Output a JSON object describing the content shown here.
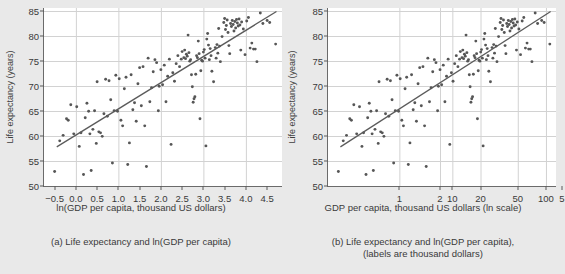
{
  "figure": {
    "background": "#e9e9e9",
    "point_color": "#565656",
    "line_color": "#5b5b5b",
    "grid_color": "#d2d2d2",
    "plot_background": "#ffffff"
  },
  "panels": [
    {
      "id": "a",
      "caption": "(a) Life expectancy and ln(GDP per capita)",
      "caption_line2": "",
      "ylabel": "Life expectancy (years)",
      "xlabel": "ln(GDP per capita, thousand US dollars)",
      "xticks": [
        "-0.5",
        "0.0",
        "0.5",
        "1.0",
        "1.5",
        "2.0",
        "2.5",
        "3.0",
        "3.5",
        "4.0",
        "4.5"
      ],
      "yticks": [
        "50",
        "55",
        "60",
        "65",
        "70",
        "75",
        "80",
        "85"
      ]
    },
    {
      "id": "b",
      "caption": "(b) Life expectancy and ln(GDP per capita),",
      "caption_line2": "(labels are thousand dollars)",
      "ylabel": "Life expectancy (years)",
      "xlabel": "GDP per capita, thousand US dollars (ln scale)",
      "xticks": [
        "1",
        "2",
        "5",
        "10",
        "20",
        "50",
        "100"
      ],
      "yticks": [
        "50",
        "55",
        "60",
        "65",
        "70",
        "75",
        "80",
        "85"
      ]
    }
  ],
  "chart_data": {
    "type": "scatter",
    "title": "",
    "n_panels": 2,
    "panel_a": {
      "type": "scatter",
      "title": "(a) Life expectancy and ln(GDP per capita)",
      "xlabel": "ln(GDP per capita, thousand US dollars)",
      "ylabel": "Life expectancy (years)",
      "xlim": [
        -0.75,
        4.85
      ],
      "ylim": [
        50,
        85.5
      ],
      "xtick_values": [
        -0.5,
        0.0,
        0.5,
        1.0,
        1.5,
        2.0,
        2.5,
        3.0,
        3.5,
        4.0,
        4.5
      ],
      "xtick_labels": [
        "-0.5",
        "0.0",
        "0.5",
        "1.0",
        "1.5",
        "2.0",
        "2.5",
        "3.0",
        "3.5",
        "4.0",
        "4.5"
      ],
      "ytick_values": [
        50,
        55,
        60,
        65,
        70,
        75,
        80,
        85
      ],
      "ytick_labels": [
        "50",
        "55",
        "60",
        "65",
        "70",
        "75",
        "80",
        "85"
      ],
      "grid": true,
      "grid_x_values": [
        0,
        1,
        2,
        3,
        4
      ],
      "grid_y_values": [
        55,
        60,
        65,
        70,
        75,
        80,
        85
      ],
      "legend": "none",
      "fit_line": {
        "x": [
          -0.45,
          4.72
        ],
        "y": [
          57.8,
          84.8
        ],
        "slope": 5.22,
        "intercept": 60.15
      },
      "x_scale": "linear",
      "points": [
        [
          -0.5,
          52.9
        ],
        [
          -0.38,
          59.0
        ],
        [
          -0.3,
          60.1
        ],
        [
          -0.22,
          63.4
        ],
        [
          -0.18,
          63.1
        ],
        [
          -0.12,
          66.2
        ],
        [
          -0.05,
          60.4
        ],
        [
          0.02,
          65.8
        ],
        [
          0.08,
          57.9
        ],
        [
          0.12,
          60.6
        ],
        [
          0.18,
          52.3
        ],
        [
          0.22,
          63.6
        ],
        [
          0.26,
          66.5
        ],
        [
          0.3,
          64.9
        ],
        [
          0.33,
          60.4
        ],
        [
          0.36,
          53.1
        ],
        [
          0.4,
          61.3
        ],
        [
          0.44,
          65.0
        ],
        [
          0.48,
          58.5
        ],
        [
          0.5,
          70.8
        ],
        [
          0.54,
          60.8
        ],
        [
          0.58,
          60.6
        ],
        [
          0.62,
          59.9
        ],
        [
          0.66,
          64.4
        ],
        [
          0.7,
          71.3
        ],
        [
          0.74,
          63.9
        ],
        [
          0.78,
          71.0
        ],
        [
          0.82,
          67.2
        ],
        [
          0.86,
          54.6
        ],
        [
          0.9,
          65.0
        ],
        [
          0.94,
          72.1
        ],
        [
          0.98,
          64.9
        ],
        [
          1.02,
          71.4
        ],
        [
          1.06,
          63.1
        ],
        [
          1.1,
          62.0
        ],
        [
          1.14,
          69.4
        ],
        [
          1.18,
          71.7
        ],
        [
          1.22,
          54.3
        ],
        [
          1.26,
          58.6
        ],
        [
          1.3,
          72.2
        ],
        [
          1.34,
          65.2
        ],
        [
          1.38,
          66.6
        ],
        [
          1.42,
          62.9
        ],
        [
          1.46,
          70.4
        ],
        [
          1.5,
          73.6
        ],
        [
          1.54,
          66.0
        ],
        [
          1.58,
          73.8
        ],
        [
          1.62,
          62.0
        ],
        [
          1.66,
          53.9
        ],
        [
          1.7,
          75.5
        ],
        [
          1.74,
          66.8
        ],
        [
          1.78,
          69.6
        ],
        [
          1.82,
          72.8
        ],
        [
          1.86,
          75.2
        ],
        [
          1.9,
          74.6
        ],
        [
          1.94,
          65.0
        ],
        [
          1.96,
          69.9
        ],
        [
          2.0,
          73.2
        ],
        [
          2.04,
          70.2
        ],
        [
          2.08,
          74.1
        ],
        [
          2.12,
          66.8
        ],
        [
          2.16,
          71.9
        ],
        [
          2.2,
          75.3
        ],
        [
          2.24,
          58.3
        ],
        [
          2.28,
          72.6
        ],
        [
          2.32,
          70.9
        ],
        [
          2.36,
          74.4
        ],
        [
          2.4,
          76.0
        ],
        [
          2.44,
          73.8
        ],
        [
          2.48,
          75.3
        ],
        [
          2.5,
          76.8
        ],
        [
          2.54,
          75.6
        ],
        [
          2.56,
          77.1
        ],
        [
          2.58,
          75.4
        ],
        [
          2.6,
          76.3
        ],
        [
          2.62,
          75.9
        ],
        [
          2.64,
          80.1
        ],
        [
          2.66,
          76.6
        ],
        [
          2.68,
          74.9
        ],
        [
          2.7,
          75.2
        ],
        [
          2.72,
          72.2
        ],
        [
          2.74,
          69.8
        ],
        [
          2.76,
          66.7
        ],
        [
          2.78,
          67.4
        ],
        [
          2.8,
          67.8
        ],
        [
          2.82,
          72.3
        ],
        [
          2.84,
          76.0
        ],
        [
          2.86,
          75.6
        ],
        [
          2.88,
          78.9
        ],
        [
          2.9,
          76.4
        ],
        [
          2.92,
          63.4
        ],
        [
          2.94,
          73.0
        ],
        [
          2.96,
          75.1
        ],
        [
          2.98,
          74.9
        ],
        [
          3.0,
          76.7
        ],
        [
          3.02,
          77.2
        ],
        [
          3.04,
          75.5
        ],
        [
          3.06,
          58.0
        ],
        [
          3.08,
          79.3
        ],
        [
          3.1,
          80.4
        ],
        [
          3.12,
          78.1
        ],
        [
          3.14,
          75.2
        ],
        [
          3.16,
          77.4
        ],
        [
          3.18,
          76.0
        ],
        [
          3.2,
          72.9
        ],
        [
          3.24,
          70.8
        ],
        [
          3.28,
          77.6
        ],
        [
          3.3,
          75.5
        ],
        [
          3.32,
          78.2
        ],
        [
          3.34,
          76.5
        ],
        [
          3.36,
          81.4
        ],
        [
          3.38,
          77.9
        ],
        [
          3.4,
          74.8
        ],
        [
          3.44,
          79.8
        ],
        [
          3.48,
          82.6
        ],
        [
          3.5,
          83.4
        ],
        [
          3.52,
          81.2
        ],
        [
          3.54,
          82.0
        ],
        [
          3.56,
          83.1
        ],
        [
          3.58,
          80.6
        ],
        [
          3.6,
          78.0
        ],
        [
          3.62,
          76.4
        ],
        [
          3.64,
          82.4
        ],
        [
          3.66,
          81.8
        ],
        [
          3.68,
          83.0
        ],
        [
          3.7,
          82.2
        ],
        [
          3.72,
          80.9
        ],
        [
          3.74,
          82.8
        ],
        [
          3.76,
          81.5
        ],
        [
          3.78,
          83.2
        ],
        [
          3.8,
          82.5
        ],
        [
          3.82,
          81.9
        ],
        [
          3.84,
          83.3
        ],
        [
          3.86,
          82.1
        ],
        [
          3.88,
          77.1
        ],
        [
          3.9,
          82.7
        ],
        [
          3.94,
          81.3
        ],
        [
          3.98,
          76.2
        ],
        [
          4.02,
          82.9
        ],
        [
          4.06,
          83.6
        ],
        [
          4.1,
          77.5
        ],
        [
          4.14,
          78.5
        ],
        [
          4.18,
          77.3
        ],
        [
          4.22,
          77.3
        ],
        [
          4.26,
          74.8
        ],
        [
          4.34,
          84.5
        ],
        [
          4.4,
          82.4
        ],
        [
          4.5,
          83.0
        ],
        [
          4.56,
          82.6
        ],
        [
          4.7,
          78.3
        ]
      ]
    },
    "panel_b": {
      "type": "scatter",
      "title": "(b) Life expectancy and ln(GDP per capita), (labels are thousand dollars)",
      "xlabel": "GDP per capita, thousand US dollars (ln scale)",
      "ylabel": "Life expectancy (years)",
      "x_scale": "log",
      "xlim": [
        0.47,
        128
      ],
      "ylim": [
        50,
        85.5
      ],
      "xtick_values": [
        1,
        2,
        5,
        10,
        20,
        50,
        100
      ],
      "xtick_labels": [
        "1",
        "2",
        "5",
        "10",
        "20",
        "50",
        "100"
      ],
      "ytick_values": [
        50,
        55,
        60,
        65,
        70,
        75,
        80,
        85
      ],
      "ytick_labels": [
        "50",
        "55",
        "60",
        "65",
        "70",
        "75",
        "80",
        "85"
      ],
      "grid": true,
      "grid_x_values": [
        1,
        2,
        5,
        10,
        20,
        50,
        100
      ],
      "grid_y_values": [
        55,
        60,
        65,
        70,
        75,
        80,
        85
      ],
      "legend": "none",
      "note": "Same data as panel (a) with x on ln scale; GDP = exp(ln value)",
      "fit_line": {
        "x_log": [
          0.638,
          112.2
        ],
        "y": [
          57.8,
          84.8
        ]
      }
    }
  }
}
